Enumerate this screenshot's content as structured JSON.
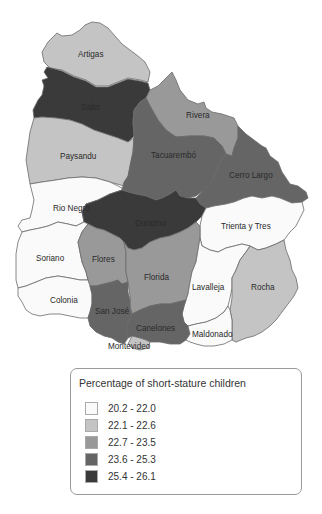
{
  "map": {
    "departments": [
      {
        "name": "Artigas",
        "class": "22.1 - 22.6"
      },
      {
        "name": "Salto",
        "class": "25.4 - 26.1"
      },
      {
        "name": "Rivera",
        "class": "22.7 - 23.5"
      },
      {
        "name": "Paysandu",
        "class": "22.1 - 22.6"
      },
      {
        "name": "Tacuarembó",
        "class": "23.6 - 25.3"
      },
      {
        "name": "Cerro Largo",
        "class": "23.6 - 25.3"
      },
      {
        "name": "Rio Negro",
        "class": "20.2 - 22.0"
      },
      {
        "name": "Durazno",
        "class": "25.4 - 26.1"
      },
      {
        "name": "Trienta y Tres",
        "class": "20.2 - 22.0"
      },
      {
        "name": "Soriano",
        "class": "20.2 - 22.0"
      },
      {
        "name": "Flores",
        "class": "22.7 - 23.5"
      },
      {
        "name": "Florida",
        "class": "22.7 - 23.5"
      },
      {
        "name": "Lavalleja",
        "class": "20.2 - 22.0"
      },
      {
        "name": "Rocha",
        "class": "22.1 - 22.6"
      },
      {
        "name": "Colonia",
        "class": "20.2 - 22.0"
      },
      {
        "name": "San José",
        "class": "23.6 - 25.3"
      },
      {
        "name": "Canelones",
        "class": "23.6 - 25.3"
      },
      {
        "name": "Maldonado",
        "class": "20.2 - 22.0"
      },
      {
        "name": "Montevideo",
        "class": "22.1 - 22.6"
      }
    ]
  },
  "legend": {
    "title": "Percentage of short-stature children",
    "items": [
      {
        "label": "20.2 - 22.0",
        "color": "#fafafa"
      },
      {
        "label": "22.1 - 22.6",
        "color": "#c4c4c4"
      },
      {
        "label": "22.7 - 23.5",
        "color": "#999999"
      },
      {
        "label": "23.6 - 25.3",
        "color": "#656565"
      },
      {
        "label": "25.4 - 26.1",
        "color": "#3a3a3a"
      }
    ]
  }
}
